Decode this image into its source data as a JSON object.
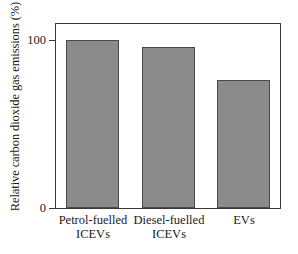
{
  "chart_data": {
    "type": "bar",
    "title": "",
    "subtitle": "",
    "xlabel": "",
    "ylabel": "Relative carbon dioxide gas emissions (%)",
    "categories": [
      "Petrol-fuelled\nICEVs",
      "Diesel-fuelled\nICEVs",
      "EVs"
    ],
    "values": [
      100,
      96,
      76
    ],
    "ylim": [
      0,
      111
    ],
    "ytick_labels": [
      "0",
      "100"
    ],
    "ytick_values": [
      0,
      100
    ],
    "grid": false,
    "legend": null,
    "annotations": [],
    "bar_fill_color": "#8b8b8c",
    "bar_edge_color": "#4a4a4c",
    "frame_color": "#3a3a3a",
    "background_color": "#ffffff"
  },
  "axes": {
    "y_title": "Relative carbon dioxide gas emissions (%)",
    "y_tick_top": "100",
    "y_tick_bottom": "0"
  },
  "bars": [
    {
      "label": "Petrol-fuelled\nICEVs",
      "value": 100
    },
    {
      "label": "Diesel-fuelled\nICEVs",
      "value": 96
    },
    {
      "label": "EVs",
      "value": 76
    }
  ]
}
